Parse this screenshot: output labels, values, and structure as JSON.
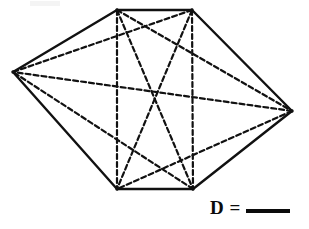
{
  "page": {
    "background_color": "#ffffff",
    "width": 309,
    "height": 229
  },
  "figure": {
    "name": "hexagon-with-all-diagonals",
    "shape": "hexagon",
    "stroke_color": "#111111",
    "perimeter_stroke_width": 2.4,
    "diagonal_stroke_width": 2.2,
    "diagonal_style": "dashed",
    "dash_pattern": "5,3",
    "fill": "none",
    "vertices": [
      {
        "id": "A",
        "label": "top-left",
        "x": 117,
        "y": 10
      },
      {
        "id": "B",
        "label": "top-right",
        "x": 192,
        "y": 10
      },
      {
        "id": "C",
        "label": "right",
        "x": 292,
        "y": 111
      },
      {
        "id": "D",
        "label": "bottom-right",
        "x": 193,
        "y": 189
      },
      {
        "id": "E",
        "label": "bottom-left",
        "x": 117,
        "y": 189
      },
      {
        "id": "F",
        "label": "left",
        "x": 13,
        "y": 72
      }
    ],
    "edges": [
      {
        "from": "A",
        "to": "B"
      },
      {
        "from": "B",
        "to": "C"
      },
      {
        "from": "C",
        "to": "D"
      },
      {
        "from": "D",
        "to": "E"
      },
      {
        "from": "E",
        "to": "F"
      },
      {
        "from": "F",
        "to": "A"
      }
    ],
    "diagonals": [
      {
        "from": "A",
        "to": "C"
      },
      {
        "from": "A",
        "to": "D"
      },
      {
        "from": "A",
        "to": "E"
      },
      {
        "from": "B",
        "to": "D"
      },
      {
        "from": "B",
        "to": "E"
      },
      {
        "from": "B",
        "to": "F"
      },
      {
        "from": "C",
        "to": "E"
      },
      {
        "from": "C",
        "to": "F"
      },
      {
        "from": "D",
        "to": "F"
      }
    ],
    "diagonal_count": 9
  },
  "answer": {
    "label": "D =",
    "blank_value": ""
  }
}
